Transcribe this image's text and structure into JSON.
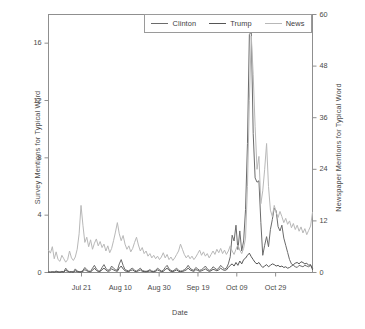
{
  "chart_data": {
    "type": "line",
    "title": "",
    "xlabel": "Date",
    "ylabel": "Survey Mentions for Typical Word",
    "ylabel_right": "Newspaper Mentions for Typical Word",
    "grid": false,
    "legend_position": "top",
    "xlim": [
      0,
      136
    ],
    "ylim": [
      0,
      18
    ],
    "ylim_right": [
      0,
      60
    ],
    "xtick_labels": [
      "Jul 21",
      "Aug 10",
      "Aug 30",
      "Sep 19",
      "Oct 09",
      "Oct 29"
    ],
    "xtick_positions": [
      17,
      37,
      57,
      77,
      97,
      117
    ],
    "ytick_labels": [
      "0",
      "4",
      "8",
      "12",
      "16"
    ],
    "ytick_values": [
      0,
      4,
      8,
      12,
      16
    ],
    "ytick_right_labels": [
      "0",
      "12",
      "24",
      "36",
      "48",
      "60"
    ],
    "ytick_right_values": [
      0,
      12,
      24,
      36,
      48,
      60
    ],
    "series": [
      {
        "name": "Clinton",
        "color": "#6b6b6b",
        "axis": "left",
        "values": [
          0.05,
          0.03,
          0.06,
          0.04,
          0.1,
          0.05,
          0.03,
          0.08,
          0.05,
          0.3,
          0.12,
          0.05,
          0.07,
          0.04,
          0.25,
          0.1,
          0.06,
          0.05,
          0.15,
          0.35,
          0.2,
          0.1,
          0.08,
          0.3,
          0.5,
          0.25,
          0.12,
          0.1,
          0.35,
          0.55,
          0.3,
          0.15,
          0.2,
          0.45,
          0.3,
          0.2,
          0.15,
          0.6,
          0.9,
          0.5,
          0.2,
          0.15,
          0.1,
          0.25,
          0.3,
          0.15,
          0.1,
          0.2,
          0.3,
          0.15,
          0.1,
          0.08,
          0.12,
          0.2,
          0.1,
          0.08,
          0.15,
          0.3,
          0.2,
          0.1,
          0.15,
          0.35,
          0.5,
          0.25,
          0.15,
          0.1,
          0.2,
          0.3,
          0.15,
          0.1,
          0.12,
          0.2,
          0.3,
          0.5,
          0.3,
          0.2,
          0.15,
          0.35,
          0.25,
          0.15,
          0.2,
          0.3,
          0.45,
          0.25,
          0.15,
          0.2,
          0.4,
          0.3,
          0.2,
          0.3,
          0.5,
          0.35,
          0.25,
          0.3,
          0.6,
          1.1,
          2.6,
          2.2,
          3.3,
          1.6,
          2.9,
          1.5,
          2.2,
          4.4,
          9.0,
          16.6,
          16.8,
          9.7,
          6.6,
          6.3,
          6.4,
          3.5,
          1.2,
          1.9,
          2.5,
          1.8,
          3.0,
          3.7,
          4.5,
          4.3,
          3.2,
          2.9,
          3.3,
          2.4,
          1.9,
          1.4,
          0.9,
          0.6,
          0.5,
          0.4,
          0.35,
          0.5,
          0.45,
          0.4,
          0.5,
          0.45,
          0.4,
          0.5,
          0.3
        ]
      },
      {
        "name": "Trump",
        "color": "#555555",
        "axis": "left",
        "values": [
          0.02,
          0.02,
          0.03,
          0.02,
          0.05,
          0.03,
          0.02,
          0.04,
          0.03,
          0.15,
          0.08,
          0.03,
          0.04,
          0.02,
          0.12,
          0.06,
          0.03,
          0.03,
          0.08,
          0.2,
          0.12,
          0.06,
          0.05,
          0.15,
          0.3,
          0.15,
          0.07,
          0.06,
          0.2,
          0.3,
          0.18,
          0.08,
          0.12,
          0.25,
          0.18,
          0.12,
          0.08,
          0.3,
          0.45,
          0.25,
          0.12,
          0.08,
          0.06,
          0.15,
          0.18,
          0.08,
          0.06,
          0.12,
          0.18,
          0.08,
          0.06,
          0.05,
          0.07,
          0.12,
          0.06,
          0.05,
          0.08,
          0.18,
          0.12,
          0.06,
          0.08,
          0.2,
          0.3,
          0.15,
          0.08,
          0.06,
          0.12,
          0.18,
          0.08,
          0.06,
          0.07,
          0.12,
          0.18,
          0.3,
          0.18,
          0.12,
          0.08,
          0.2,
          0.15,
          0.08,
          0.12,
          0.18,
          0.25,
          0.15,
          0.08,
          0.12,
          0.22,
          0.18,
          0.12,
          0.18,
          0.3,
          0.2,
          0.15,
          0.18,
          0.35,
          0.5,
          0.6,
          0.45,
          0.7,
          0.5,
          0.8,
          0.6,
          0.9,
          1.0,
          1.2,
          1.35,
          1.1,
          0.9,
          0.7,
          0.6,
          0.7,
          0.5,
          0.35,
          0.45,
          0.55,
          0.4,
          0.5,
          0.6,
          0.55,
          0.45,
          0.5,
          0.4,
          0.45,
          0.35,
          0.4,
          0.3,
          0.35,
          0.45,
          0.55,
          0.65,
          0.7,
          0.6,
          0.75,
          0.7,
          0.6,
          0.65,
          0.5,
          0.55,
          0.2
        ]
      },
      {
        "name": "News",
        "color": "#b8b8b8",
        "axis": "right",
        "values": [
          5.2,
          4.5,
          6.0,
          3.2,
          4.8,
          3.0,
          2.6,
          4.0,
          3.2,
          2.4,
          3.0,
          5.0,
          3.4,
          2.8,
          3.6,
          5.4,
          9.0,
          15.6,
          11.0,
          7.0,
          8.2,
          6.0,
          7.6,
          5.4,
          6.8,
          7.8,
          6.2,
          7.2,
          5.8,
          6.6,
          5.0,
          6.2,
          4.6,
          5.6,
          7.4,
          9.4,
          11.6,
          9.0,
          7.4,
          8.6,
          6.6,
          5.4,
          6.2,
          4.8,
          5.6,
          7.0,
          8.2,
          6.4,
          5.0,
          5.8,
          4.4,
          5.0,
          3.8,
          4.4,
          3.4,
          4.0,
          3.2,
          3.8,
          3.0,
          3.6,
          4.6,
          3.4,
          4.2,
          3.0,
          3.6,
          2.8,
          3.4,
          4.2,
          5.0,
          6.6,
          5.4,
          4.2,
          3.4,
          4.0,
          3.2,
          3.8,
          3.0,
          3.6,
          4.4,
          5.2,
          4.0,
          4.8,
          3.8,
          4.4,
          3.4,
          4.2,
          5.0,
          4.2,
          5.4,
          4.6,
          5.6,
          4.4,
          5.2,
          4.2,
          5.0,
          6.2,
          5.0,
          4.2,
          5.4,
          6.4,
          5.2,
          4.4,
          5.6,
          8.0,
          20.0,
          40.0,
          55.0,
          46.0,
          34.0,
          24.0,
          27.0,
          16.0,
          19.0,
          24.0,
          30.0,
          20.0,
          14.5,
          13.0,
          15.6,
          14.0,
          12.8,
          14.2,
          13.0,
          11.6,
          12.6,
          11.2,
          12.0,
          10.4,
          11.4,
          10.0,
          11.0,
          9.6,
          10.6,
          9.2,
          10.2,
          8.8,
          9.8,
          10.8,
          14.0
        ]
      }
    ]
  }
}
